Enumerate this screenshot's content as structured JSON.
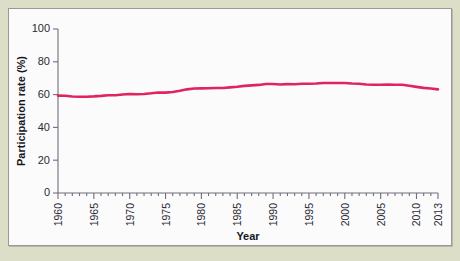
{
  "figure": {
    "background_color": "#dcdec8",
    "panel_color": "#fbfbfc",
    "panel_border_color": "#9a9a93"
  },
  "chart_data": {
    "type": "line",
    "title": "",
    "xlabel": "Year",
    "ylabel": "Participation rate (%)",
    "xlim": [
      1960,
      2013
    ],
    "ylim": [
      0,
      100
    ],
    "grid": false,
    "legend": "none",
    "series_color": "#e0245e",
    "ytick_labels": [
      "0",
      "20",
      "40",
      "60",
      "80",
      "100"
    ],
    "ytick_values": [
      0,
      20,
      40,
      60,
      80,
      100
    ],
    "xtick_labels": [
      "1960",
      "1965",
      "1970",
      "1975",
      "1980",
      "1985",
      "1990",
      "1995",
      "2000",
      "2005",
      "2010",
      "2013"
    ],
    "xtick_values": [
      1960,
      1965,
      1970,
      1975,
      1980,
      1985,
      1990,
      1995,
      2000,
      2005,
      2010,
      2013
    ],
    "xtick_minor_values": [
      1961,
      1962,
      1963,
      1964,
      1966,
      1967,
      1968,
      1969,
      1971,
      1972,
      1973,
      1974,
      1976,
      1977,
      1978,
      1979,
      1981,
      1982,
      1983,
      1984,
      1986,
      1987,
      1988,
      1989,
      1991,
      1992,
      1993,
      1994,
      1996,
      1997,
      1998,
      1999,
      2001,
      2002,
      2003,
      2004,
      2006,
      2007,
      2008,
      2009,
      2011,
      2012
    ],
    "series": [
      {
        "name": "Participation rate",
        "x": [
          1960,
          1961,
          1962,
          1963,
          1964,
          1965,
          1966,
          1967,
          1968,
          1969,
          1970,
          1971,
          1972,
          1973,
          1974,
          1975,
          1976,
          1977,
          1978,
          1979,
          1980,
          1981,
          1982,
          1983,
          1984,
          1985,
          1986,
          1987,
          1988,
          1989,
          1990,
          1991,
          1992,
          1993,
          1994,
          1995,
          1996,
          1997,
          1998,
          1999,
          2000,
          2001,
          2002,
          2003,
          2004,
          2005,
          2006,
          2007,
          2008,
          2009,
          2010,
          2011,
          2012,
          2013
        ],
        "values": [
          59.4,
          59.3,
          58.8,
          58.7,
          58.7,
          58.9,
          59.2,
          59.6,
          59.6,
          60.1,
          60.4,
          60.2,
          60.4,
          60.8,
          61.3,
          61.2,
          61.6,
          62.3,
          63.2,
          63.7,
          63.8,
          63.9,
          64.0,
          64.0,
          64.4,
          64.8,
          65.3,
          65.6,
          65.9,
          66.5,
          66.5,
          66.2,
          66.4,
          66.3,
          66.6,
          66.6,
          66.8,
          67.1,
          67.1,
          67.1,
          67.1,
          66.8,
          66.6,
          66.2,
          66.0,
          66.0,
          66.2,
          66.0,
          66.0,
          65.4,
          64.7,
          64.1,
          63.7,
          63.2
        ]
      }
    ]
  }
}
